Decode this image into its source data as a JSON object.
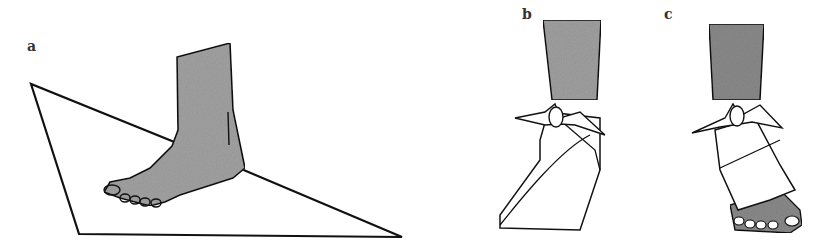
{
  "figure": {
    "panels": [
      {
        "label": "a",
        "description": "foot placed on triangular bandage"
      },
      {
        "label": "b",
        "description": "triangular bandage wrapped and tied at ankle, foot covered"
      },
      {
        "label": "c",
        "description": "figure-of-eight ankle bandage tied, toes exposed"
      }
    ],
    "colors": {
      "line": "#111111",
      "skin": "#9a9a9a",
      "background": "#ffffff"
    }
  }
}
